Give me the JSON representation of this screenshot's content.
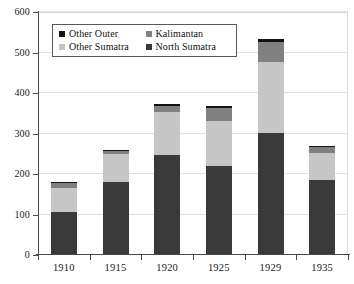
{
  "chart_data": {
    "type": "bar",
    "stacked": true,
    "title": "",
    "subtitle": "",
    "xlabel": "",
    "ylabel": "",
    "categories": [
      "1910",
      "1915",
      "1920",
      "1925",
      "1929",
      "1935"
    ],
    "ylim": [
      0,
      600
    ],
    "yticks": [
      0,
      100,
      200,
      300,
      400,
      500,
      600
    ],
    "ytick_labels": [
      "0",
      "100",
      "200",
      "300",
      "400",
      "500",
      "600"
    ],
    "grid": true,
    "grid_axis": "y",
    "legend_position": "upper-left",
    "stack_order_bottom_to_top": [
      "North Sumatra",
      "Other Sumatra",
      "Kalimantan",
      "Other Outer"
    ],
    "series": [
      {
        "name": "North Sumatra",
        "color": "#3a3a3a",
        "values": [
          107,
          180,
          248,
          220,
          302,
          185
        ]
      },
      {
        "name": "Other Sumatra",
        "color": "#c6c6c6",
        "values": [
          58,
          70,
          105,
          110,
          175,
          68
        ]
      },
      {
        "name": "Kalimantan",
        "color": "#808080",
        "values": [
          12,
          7,
          15,
          32,
          48,
          13
        ]
      },
      {
        "name": "Other Outer",
        "color": "#141414",
        "values": [
          4,
          3,
          5,
          6,
          9,
          3
        ]
      }
    ],
    "totals": [
      181,
      260,
      373,
      368,
      534,
      269
    ]
  },
  "legend": {
    "entries": [
      {
        "label": "Other Outer",
        "color": "#141414"
      },
      {
        "label": "Kalimantan",
        "color": "#808080"
      },
      {
        "label": "Other Sumatra",
        "color": "#c6c6c6"
      },
      {
        "label": "North Sumatra",
        "color": "#3a3a3a"
      }
    ]
  },
  "colors": {
    "background": "#ffffff",
    "axis": "#4a4a4a",
    "gridline": "#e2e2e2",
    "text": "#1a1a1a",
    "legend_border": "#585858"
  }
}
